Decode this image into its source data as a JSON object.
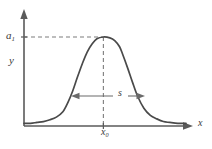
{
  "figure": {
    "background_color": "#ffffff",
    "curve_color": "#4a4a4a",
    "axis_color": "#5a5a5a",
    "guide_color": "#7d7d7d"
  },
  "labels": {
    "amplitude_symbol": "a",
    "amplitude_subscript": "1",
    "y_axis": "y",
    "x_axis": "x",
    "x_center_symbol": "x",
    "x_center_subscript": "0",
    "width_symbol": "s"
  },
  "chart_data": {
    "type": "line",
    "title": "",
    "subtitle": "",
    "xlabel": "x",
    "ylabel": "y",
    "xlim": [
      0,
      1
    ],
    "ylim": [
      0,
      1.12
    ],
    "grid": false,
    "legend": false,
    "annotations": [
      {
        "name": "peak-amplitude-guide",
        "type": "horizontal-dashed-line",
        "label": "a1",
        "y_value": 1.0,
        "x_from": 0.0,
        "x_to": 0.49
      },
      {
        "name": "center-position-guide",
        "type": "vertical-dashed-line",
        "label": "x0",
        "x_value": 0.49,
        "y_from": 0.0,
        "y_to": 1.0
      },
      {
        "name": "width-marker",
        "type": "double-headed-arrow",
        "label": "s",
        "y_value": 0.5,
        "x_from": 0.29,
        "x_to": 0.67
      }
    ],
    "series": [
      {
        "name": "profile",
        "x": [
          0.0,
          0.04,
          0.08,
          0.12,
          0.16,
          0.2,
          0.24,
          0.27,
          0.3,
          0.33,
          0.36,
          0.39,
          0.42,
          0.45,
          0.49,
          0.53,
          0.56,
          0.59,
          0.61,
          0.64,
          0.67,
          0.7,
          0.74,
          0.78,
          0.82,
          0.86,
          0.9,
          0.95,
          1.0
        ],
        "y": [
          0.03,
          0.03,
          0.04,
          0.05,
          0.07,
          0.1,
          0.16,
          0.26,
          0.39,
          0.55,
          0.7,
          0.83,
          0.92,
          0.98,
          1.0,
          0.99,
          0.96,
          0.89,
          0.8,
          0.65,
          0.49,
          0.34,
          0.2,
          0.12,
          0.08,
          0.05,
          0.04,
          0.03,
          0.03
        ]
      }
    ]
  }
}
